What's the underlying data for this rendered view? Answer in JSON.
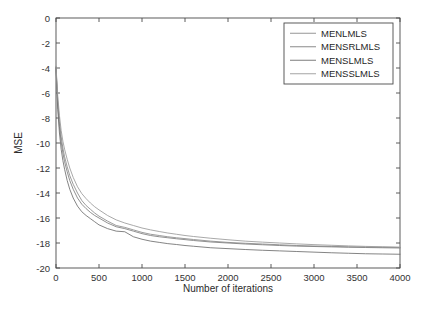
{
  "chart_data": {
    "type": "line",
    "title": "",
    "xlabel": "Number of iterations",
    "ylabel": "MSE",
    "xlim": [
      0,
      4000
    ],
    "ylim": [
      -20,
      0
    ],
    "xticks": [
      0,
      500,
      1000,
      1500,
      2000,
      2500,
      3000,
      3500,
      4000
    ],
    "xtick_labels": [
      "0",
      "500",
      "1000",
      "1500",
      "2000",
      "2500",
      "3000",
      "3500",
      "4000"
    ],
    "yticks": [
      0,
      -2,
      -4,
      -6,
      -8,
      -10,
      -12,
      -14,
      -16,
      -18,
      -20
    ],
    "ytick_labels": [
      "0",
      "-2",
      "-4",
      "-6",
      "-8",
      "-10",
      "-12",
      "-14",
      "-16",
      "-18",
      "-20"
    ],
    "grid": false,
    "legend_position": "upper right",
    "x": [
      0,
      20,
      40,
      60,
      80,
      100,
      130,
      160,
      200,
      250,
      300,
      350,
      400,
      450,
      500,
      600,
      700,
      800,
      900,
      1000,
      1100,
      1200,
      1300,
      1400,
      1500,
      1600,
      1800,
      2000,
      2200,
      2400,
      2600,
      2800,
      3000,
      3200,
      3400,
      3600,
      3800,
      4000
    ],
    "series": [
      {
        "name": "MENLMLS",
        "color": "#8a8a8a",
        "values": [
          -3.9,
          -6.6,
          -8.3,
          -9.5,
          -10.4,
          -11.1,
          -11.9,
          -12.6,
          -13.3,
          -14.0,
          -14.6,
          -15.0,
          -15.3,
          -15.6,
          -15.85,
          -16.25,
          -16.6,
          -16.75,
          -16.95,
          -17.15,
          -17.3,
          -17.4,
          -17.5,
          -17.58,
          -17.65,
          -17.72,
          -17.85,
          -17.95,
          -18.02,
          -18.08,
          -18.14,
          -18.2,
          -18.24,
          -18.27,
          -18.3,
          -18.32,
          -18.34,
          -18.36
        ]
      },
      {
        "name": "MENSRLMLS",
        "color": "#7d7d7d",
        "values": [
          -3.95,
          -6.9,
          -8.7,
          -9.9,
          -10.8,
          -11.5,
          -12.3,
          -13.0,
          -13.7,
          -14.4,
          -14.9,
          -15.25,
          -15.55,
          -15.8,
          -16.0,
          -16.4,
          -16.7,
          -16.85,
          -17.05,
          -17.25,
          -17.4,
          -17.5,
          -17.58,
          -17.66,
          -17.73,
          -17.8,
          -17.92,
          -18.0,
          -18.08,
          -18.14,
          -18.2,
          -18.25,
          -18.28,
          -18.31,
          -18.34,
          -18.36,
          -18.38,
          -18.4
        ]
      },
      {
        "name": "MENSLMLS",
        "color": "#6e6e6e",
        "values": [
          -4.0,
          -7.3,
          -9.2,
          -10.5,
          -11.4,
          -12.1,
          -13.0,
          -13.7,
          -14.4,
          -15.05,
          -15.5,
          -15.8,
          -16.05,
          -16.3,
          -16.55,
          -16.85,
          -17.05,
          -17.1,
          -17.5,
          -17.7,
          -17.85,
          -17.95,
          -18.05,
          -18.12,
          -18.2,
          -18.26,
          -18.38,
          -18.45,
          -18.52,
          -18.58,
          -18.63,
          -18.68,
          -18.73,
          -18.78,
          -18.82,
          -18.86,
          -18.88,
          -18.9
        ]
      },
      {
        "name": "MENSSLMLS",
        "color": "#9a9a9a",
        "values": [
          -3.85,
          -6.2,
          -7.8,
          -9.0,
          -9.85,
          -10.5,
          -11.3,
          -12.0,
          -12.75,
          -13.5,
          -14.05,
          -14.45,
          -14.8,
          -15.1,
          -15.35,
          -15.8,
          -16.15,
          -16.4,
          -16.6,
          -16.8,
          -16.95,
          -17.08,
          -17.2,
          -17.3,
          -17.4,
          -17.48,
          -17.62,
          -17.74,
          -17.85,
          -17.93,
          -18.0,
          -18.07,
          -18.13,
          -18.18,
          -18.23,
          -18.27,
          -18.3,
          -18.33
        ]
      }
    ]
  }
}
